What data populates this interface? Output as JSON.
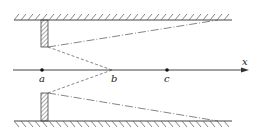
{
  "diagram": {
    "axis": {
      "label": "x"
    },
    "points": [
      {
        "id": "a",
        "label": "a",
        "x": 42,
        "marked": true
      },
      {
        "id": "b",
        "label": "b",
        "x": 112,
        "marked": false
      },
      {
        "id": "c",
        "label": "c",
        "x": 167,
        "marked": true
      }
    ],
    "colors": {
      "line": "#333333",
      "hatch": "#555555",
      "dash": "#555555"
    }
  }
}
